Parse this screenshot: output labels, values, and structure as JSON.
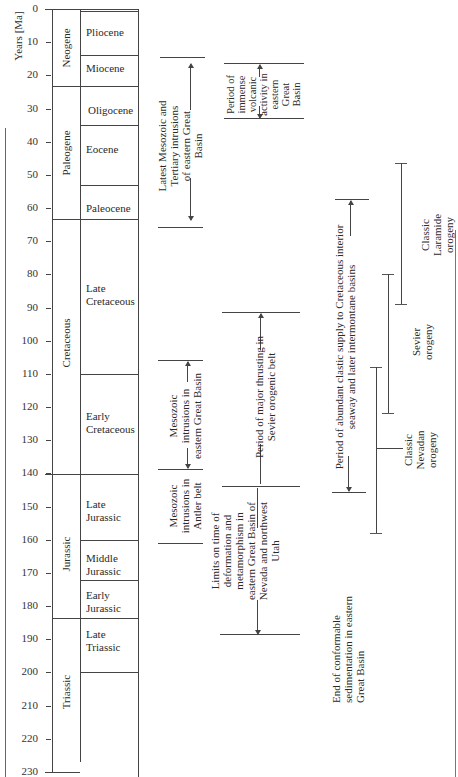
{
  "axis": {
    "title": "Years [Ma]",
    "ticks": [
      "0",
      "10",
      "20",
      "30",
      "40",
      "50",
      "60",
      "70",
      "80",
      "90",
      "100",
      "110",
      "120",
      "130",
      "140",
      "150",
      "160",
      "170",
      "180",
      "190",
      "200",
      "210",
      "220",
      "230"
    ]
  },
  "periods": [
    {
      "name": "Neogene",
      "start_ma": 0,
      "end_ma": 23
    },
    {
      "name": "Paleogene",
      "start_ma": 23,
      "end_ma": 63.5
    },
    {
      "name": "Cretaceous",
      "start_ma": 63.5,
      "end_ma": 140
    },
    {
      "name": "Jurassic",
      "start_ma": 140,
      "end_ma": 183.5
    },
    {
      "name": "Triassic",
      "start_ma": 183.5,
      "end_ma": 230
    }
  ],
  "epochs": [
    {
      "name": "Pliocene",
      "start_ma": 0,
      "end_ma": 14
    },
    {
      "name": "Miocene",
      "start_ma": 14,
      "end_ma": 23
    },
    {
      "name": "Oligocene",
      "start_ma": 23,
      "end_ma": 35
    },
    {
      "name": "Eocene",
      "start_ma": 35,
      "end_ma": 53
    },
    {
      "name": "Paleocene",
      "start_ma": 53,
      "end_ma": 63.5
    },
    {
      "name": "Late Cretaceous",
      "line1": "Late",
      "line2": "Cretaceous",
      "start_ma": 63.5,
      "end_ma": 110
    },
    {
      "name": "Early Cretaceous",
      "line1": "Early",
      "line2": "Cretaceous",
      "start_ma": 110,
      "end_ma": 140
    },
    {
      "name": "Late Jurassic",
      "line1": "Late",
      "line2": "Jurassic",
      "start_ma": 140,
      "end_ma": 160
    },
    {
      "name": "Middle Jurassic",
      "line1": "Middle",
      "line2": "Jurassic",
      "start_ma": 160,
      "end_ma": 172
    },
    {
      "name": "Early Jurassic",
      "line1": "Early",
      "line2": "Jurassic",
      "start_ma": 172,
      "end_ma": 183.5
    },
    {
      "name": "Late Triassic",
      "line1": "Late",
      "line2": "Triassic",
      "start_ma": 183.5,
      "end_ma": 200
    }
  ],
  "events": [
    {
      "id": "latest-intrusions",
      "label_lines": [
        "Latest Mesozoic and",
        "Tertiary intrusions",
        "of eastern Great",
        "Basin"
      ],
      "start_ma": 15,
      "end_ma": 66
    },
    {
      "id": "volcanic",
      "label_lines": [
        "Period of",
        "immense",
        "volcanic",
        "activity in",
        "eastern",
        "Great",
        "Basin"
      ],
      "start_ma": 17,
      "end_ma": 34
    },
    {
      "id": "mesozoic-intrusions-eastern",
      "label_lines": [
        "Mesozoic",
        "intrusions in",
        "eastern Great Basin"
      ],
      "start_ma": 106,
      "end_ma": 139
    },
    {
      "id": "mesozoic-intrusions-antler",
      "label_lines": [
        "Mesozoic",
        "intrusions in",
        "Antler belt"
      ],
      "start_ma": 139,
      "end_ma": 161
    },
    {
      "id": "sevier-thrusting",
      "label_lines": [
        "Period of major thrusting in",
        "Sevier orogenic belt"
      ],
      "start_ma": 92,
      "end_ma": 144
    },
    {
      "id": "limits-deformation",
      "label_lines": [
        "Limits on time of",
        "deformation and",
        "metamorphism in",
        "eastern Great Basin of",
        "Nevada and northwest",
        "Utah"
      ],
      "start_ma": 144,
      "end_ma": 189
    },
    {
      "id": "clastic-supply",
      "label_lines": [
        "Period of abundant clastic supply to Cretaceous interior",
        "seaway and later intermontane basins"
      ],
      "start_ma": 58,
      "end_ma": 146
    },
    {
      "id": "end-conformable",
      "label_lines": [
        "End of conformable",
        "sedimentation in eastern",
        "Great Basin"
      ],
      "at_ma": 158
    },
    {
      "id": "nevadan",
      "label_lines": [
        "Classic",
        "Nevadan",
        "orogeny"
      ],
      "start_ma": 108,
      "end_ma": 158
    },
    {
      "id": "sevier-orogeny",
      "label_lines": [
        "Sevier",
        "orogeny"
      ],
      "start_ma": 80,
      "end_ma": 122
    },
    {
      "id": "laramide",
      "label_lines": [
        "Classic",
        "Laramide",
        "orogeny"
      ],
      "start_ma": 47,
      "end_ma": 89
    }
  ]
}
